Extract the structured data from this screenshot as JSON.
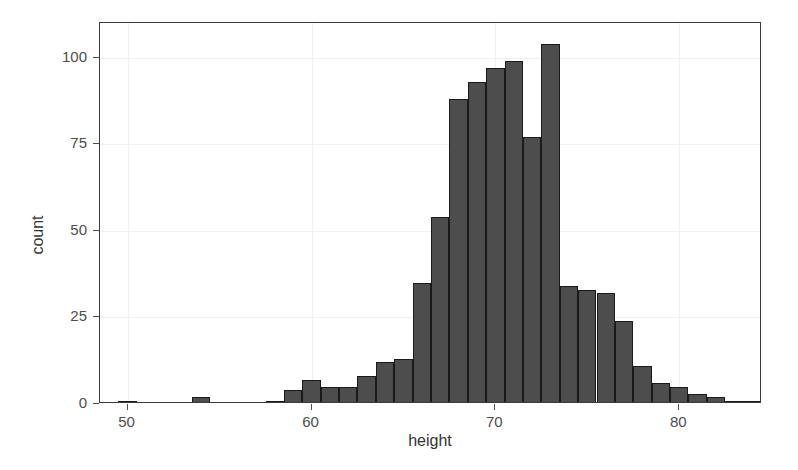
{
  "chart_data": {
    "type": "bar",
    "title": "",
    "subtitle": "",
    "xlabel": "height",
    "ylabel": "count",
    "xlim": [
      48.5,
      84.5
    ],
    "ylim": [
      0,
      110
    ],
    "grid": true,
    "legend": null,
    "bin_width": 1,
    "x_ticks": [
      "50",
      "60",
      "70",
      "80"
    ],
    "x_tick_values": [
      50,
      60,
      70,
      80
    ],
    "y_ticks": [
      "0",
      "25",
      "50",
      "75",
      "100"
    ],
    "y_tick_values": [
      0,
      25,
      50,
      75,
      100
    ],
    "bar_fill": "#4d4d4d",
    "bar_stroke": "#1a1a1a",
    "panel_background": "#ffffff",
    "grid_color": "#efefef",
    "categories": [
      50,
      54,
      58,
      59,
      60,
      61,
      62,
      63,
      64,
      65,
      66,
      67,
      68,
      69,
      70,
      71,
      72,
      73,
      74,
      75,
      76,
      77,
      78,
      79,
      80,
      81,
      83
    ],
    "values": [
      1,
      2,
      1,
      4,
      7,
      5,
      5,
      8,
      12,
      13,
      35,
      54,
      88,
      93,
      97,
      99,
      77,
      104,
      34,
      33,
      32,
      24,
      11,
      6,
      5,
      3,
      1
    ],
    "bars": [
      {
        "x": 50,
        "count": 1
      },
      {
        "x": 54,
        "count": 2
      },
      {
        "x": 58,
        "count": 1
      },
      {
        "x": 59,
        "count": 4
      },
      {
        "x": 60,
        "count": 7
      },
      {
        "x": 61,
        "count": 5
      },
      {
        "x": 62,
        "count": 5
      },
      {
        "x": 63,
        "count": 8
      },
      {
        "x": 64,
        "count": 12
      },
      {
        "x": 65,
        "count": 13
      },
      {
        "x": 66,
        "count": 35
      },
      {
        "x": 67,
        "count": 54
      },
      {
        "x": 68,
        "count": 88
      },
      {
        "x": 69,
        "count": 93
      },
      {
        "x": 70,
        "count": 97
      },
      {
        "x": 71,
        "count": 99
      },
      {
        "x": 72,
        "count": 77
      },
      {
        "x": 73,
        "count": 104
      },
      {
        "x": 74,
        "count": 34
      },
      {
        "x": 75,
        "count": 33
      },
      {
        "x": 76,
        "count": 32
      },
      {
        "x": 77,
        "count": 24
      },
      {
        "x": 78,
        "count": 11
      },
      {
        "x": 79,
        "count": 6
      },
      {
        "x": 80,
        "count": 5
      },
      {
        "x": 81,
        "count": 3
      },
      {
        "x": 82,
        "count": 2
      },
      {
        "x": 83,
        "count": 1
      },
      {
        "x": 84,
        "count": 1
      }
    ]
  },
  "axes": {
    "x_title": "height",
    "y_title": "count"
  }
}
